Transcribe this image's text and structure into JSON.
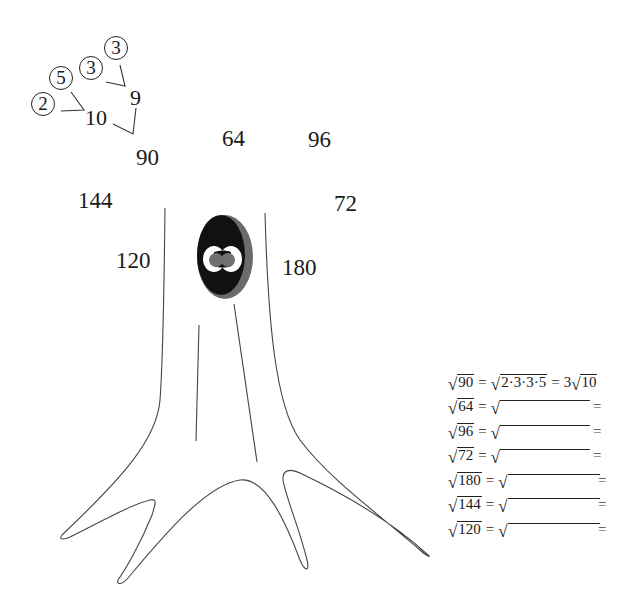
{
  "factor_tree_example": {
    "root": "90",
    "level1": [
      "10",
      "9"
    ],
    "leaves_of_10": [
      "2",
      "5"
    ],
    "leaves_of_9": [
      "3",
      "3"
    ]
  },
  "tree_numbers": {
    "n90": "90",
    "n64": "64",
    "n96": "96",
    "n144": "144",
    "n72": "72",
    "n120": "120",
    "n180": "180"
  },
  "equations": [
    {
      "radicand": "90",
      "factored": "2·3·3·5",
      "result_coef": "3",
      "result_radicand": "10",
      "eq1": "=",
      "eq2": "="
    },
    {
      "radicand": "64",
      "eq1": "=",
      "eq2": "="
    },
    {
      "radicand": "96",
      "eq1": "=",
      "eq2": "="
    },
    {
      "radicand": "72",
      "eq1": "=",
      "eq2": "="
    },
    {
      "radicand": "180",
      "eq1": "=",
      "eq2": "="
    },
    {
      "radicand": "144",
      "eq1": "=",
      "eq2": "="
    },
    {
      "radicand": "120",
      "eq1": "=",
      "eq2": "="
    }
  ],
  "radical_symbol": "√",
  "colors": {
    "ink": "#1a1a1a",
    "hole_outer": "#6b6b6b",
    "hole_inner": "#111111",
    "eye_white": "#ffffff",
    "pupil": "#707070"
  }
}
